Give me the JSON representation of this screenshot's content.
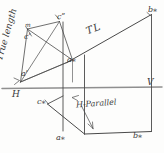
{
  "figure": {
    "kind": "descriptive-geometry-sketch",
    "medium": "hand-drawn pencil sketch",
    "background_color": "#fdfdfc",
    "ink_color": "#3b3b3b"
  },
  "labels": {
    "true_length_axis": "True length",
    "tl": "TL",
    "h_parallel": "H-Parallel",
    "c_double_prime": "cʺ",
    "c_prime": "cʹ",
    "m": "m",
    "a_prime": "aʹ",
    "a_star_mid": "a⁎",
    "b_star_top": "b⁎",
    "h_plane": "H",
    "v_plane": "V",
    "c_star": "c⁎",
    "a_star_bottom": "a⁎",
    "b_star_bottom": "b⁎"
  },
  "geometry": {
    "fold_line_label_left": "H",
    "fold_line_label_right": "V",
    "notes": "auxiliary projection: true-length line TL from a* to b*, H-Parallel base line a*-b*"
  }
}
